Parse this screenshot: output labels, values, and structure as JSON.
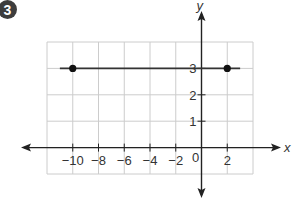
{
  "problem": {
    "number": "3"
  },
  "chart_data": {
    "type": "line",
    "title": "",
    "xlabel": "x",
    "ylabel": "y",
    "xlim": [
      -12,
      4
    ],
    "ylim": [
      -1,
      4
    ],
    "grid": true,
    "x_grid_step": 2,
    "y_grid_step": 1,
    "x_ticks": [
      {
        "value": -10,
        "label": "−10"
      },
      {
        "value": -8,
        "label": "−8"
      },
      {
        "value": -6,
        "label": "−6"
      },
      {
        "value": -4,
        "label": "−4"
      },
      {
        "value": -2,
        "label": "−2"
      },
      {
        "value": 0,
        "label": "0"
      },
      {
        "value": 2,
        "label": "2"
      }
    ],
    "y_ticks": [
      {
        "value": 1,
        "label": "1"
      },
      {
        "value": 2,
        "label": "2"
      },
      {
        "value": 3,
        "label": "3"
      }
    ],
    "series": [
      {
        "name": "horizontal line y = 3",
        "segment": {
          "x_start": -11,
          "x_end": 3,
          "y": 3
        },
        "points": [
          {
            "x": -10,
            "y": 3
          },
          {
            "x": 2,
            "y": 3
          }
        ]
      }
    ],
    "colors": {
      "grid": "#cccccc",
      "axis": "#222222",
      "line": "#333333",
      "point": "#111111",
      "badge": "#3d3d3d"
    }
  }
}
